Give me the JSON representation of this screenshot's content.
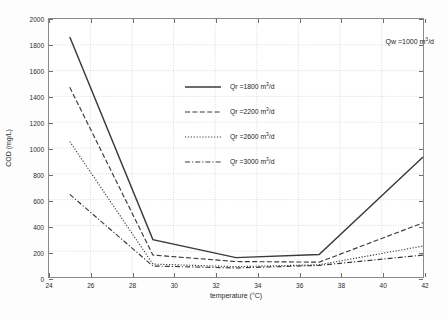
{
  "chart_data": {
    "type": "line",
    "title": "",
    "xlabel": "temperature (°C)",
    "ylabel": "COD (mg/L)",
    "xlim": [
      24,
      42
    ],
    "ylim": [
      0,
      2000
    ],
    "xticks": [
      24,
      26,
      28,
      30,
      32,
      34,
      36,
      38,
      40,
      42
    ],
    "yticks": [
      0,
      200,
      400,
      600,
      800,
      1000,
      1200,
      1400,
      1600,
      1800,
      2000
    ],
    "grid": true,
    "legend_position": "center-top-left",
    "annotations": [
      {
        "text": "Qw =1000 m3/d",
        "text_prefix": "Qw =1000 m",
        "exponent": "3",
        "text_suffix": "/d"
      }
    ],
    "x": [
      25,
      29,
      33,
      37,
      42
    ],
    "series": [
      {
        "name": "Qr =1800 m3/d",
        "label_prefix": "Qr =1800 m",
        "label_exponent": "3",
        "label_suffix": "/d",
        "style": "solid",
        "color": "#3a3a3a",
        "values": [
          1860,
          290,
          150,
          175,
          930
        ]
      },
      {
        "name": "Qr =2200 m3/d",
        "label_prefix": "Qr =2200 m",
        "label_exponent": "3",
        "label_suffix": "/d",
        "style": "dashed",
        "color": "#3a3a3a",
        "values": [
          1470,
          170,
          120,
          115,
          420
        ]
      },
      {
        "name": "Qr =2600 m3/d",
        "label_prefix": "Qr =2600 m",
        "label_exponent": "3",
        "label_suffix": "/d",
        "style": "dotted",
        "color": "#3a3a3a",
        "values": [
          1050,
          100,
          80,
          95,
          240
        ]
      },
      {
        "name": "Qr =3000 m3/d",
        "label_prefix": "Qr =3000 m",
        "label_exponent": "3",
        "label_suffix": "/d",
        "style": "dashdot",
        "color": "#3a3a3a",
        "values": [
          640,
          85,
          70,
          90,
          170
        ]
      }
    ]
  }
}
